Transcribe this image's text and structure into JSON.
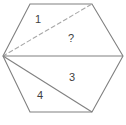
{
  "figure": {
    "width": 126,
    "height": 125,
    "background_color": "#ffffff",
    "stroke_color": "#808080",
    "dashed_stroke_color": "#a8a8a8",
    "label_color": "#3f3f3f",
    "stroke_width": 1.1
  },
  "shape": {
    "name": "hexagon",
    "vertices": [
      {
        "id": "left",
        "x": 3,
        "y": 56
      },
      {
        "id": "top-left",
        "x": 30,
        "y": 4
      },
      {
        "id": "top-right",
        "x": 92,
        "y": 4
      },
      {
        "id": "right",
        "x": 123,
        "y": 56
      },
      {
        "id": "bottom-right",
        "x": 92,
        "y": 112
      },
      {
        "id": "bottom-left",
        "x": 30,
        "y": 112
      }
    ],
    "outline_path": "M 3 56 L 30 4 L 92 4 L 123 56 L 92 112 L 30 112 Z"
  },
  "cevians": [
    {
      "id": "left-to-top-right",
      "from": "left",
      "to": "top-right",
      "style": "dashed",
      "path": "M 3 56 L 92 4"
    },
    {
      "id": "left-to-right",
      "from": "left",
      "to": "right",
      "style": "solid",
      "path": "M 3 56 L 123 56"
    },
    {
      "id": "left-to-bottom-right",
      "from": "left",
      "to": "bottom-right",
      "style": "solid",
      "path": "M 3 56 L 92 112"
    }
  ],
  "labels": [
    {
      "id": "region-1",
      "text": "1",
      "x": 38,
      "y": 20
    },
    {
      "id": "region-2",
      "text": "?",
      "x": 71,
      "y": 39
    },
    {
      "id": "region-3",
      "text": "3",
      "x": 72,
      "y": 78
    },
    {
      "id": "region-4",
      "text": "4",
      "x": 40,
      "y": 96
    }
  ]
}
